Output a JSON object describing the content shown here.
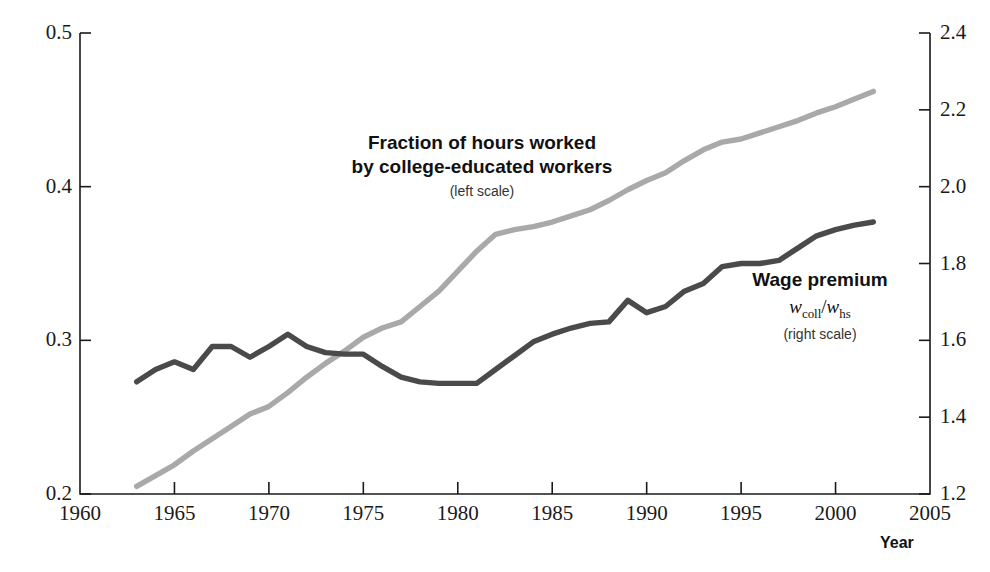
{
  "chart_data": {
    "type": "line",
    "title": "",
    "xlabel": "Year",
    "ylabel": "",
    "grid": false,
    "legend_position": "inline-annotations",
    "x_axis": {
      "label": "Year",
      "min": 1960,
      "max": 2005,
      "ticks": [
        1960,
        1965,
        1970,
        1975,
        1980,
        1985,
        1990,
        1995,
        2000,
        2005
      ],
      "tick_labels": [
        "1960",
        "1965",
        "1970",
        "1975",
        "1980",
        "1985",
        "1990",
        "1995",
        "2000",
        "2005"
      ]
    },
    "y_axis_left": {
      "min": 0.2,
      "max": 0.5,
      "ticks": [
        0.2,
        0.3,
        0.4,
        0.5
      ],
      "tick_labels": [
        "0.2",
        "0.3",
        "0.4",
        "0.5"
      ]
    },
    "y_axis_right": {
      "min": 1.2,
      "max": 2.4,
      "ticks": [
        1.2,
        1.4,
        1.6,
        1.8,
        2.0,
        2.2,
        2.4
      ],
      "tick_labels": [
        "1.2",
        "1.4",
        "1.6",
        "1.8",
        "2.0",
        "2.2",
        "2.4"
      ]
    },
    "series": [
      {
        "name": "Fraction of hours worked by college-educated workers",
        "axis": "left",
        "color": "#a9a9a9",
        "x": [
          1963,
          1964,
          1965,
          1966,
          1967,
          1968,
          1969,
          1970,
          1971,
          1972,
          1973,
          1974,
          1975,
          1976,
          1977,
          1978,
          1979,
          1980,
          1981,
          1982,
          1983,
          1984,
          1985,
          1986,
          1987,
          1988,
          1989,
          1990,
          1991,
          1992,
          1993,
          1994,
          1995,
          1996,
          1997,
          1998,
          1999,
          2000,
          2001,
          2002
        ],
        "values": [
          0.205,
          0.212,
          0.219,
          0.228,
          0.236,
          0.244,
          0.252,
          0.257,
          0.266,
          0.276,
          0.285,
          0.293,
          0.302,
          0.308,
          0.312,
          0.322,
          0.332,
          0.345,
          0.358,
          0.369,
          0.372,
          0.374,
          0.377,
          0.381,
          0.385,
          0.391,
          0.398,
          0.404,
          0.409,
          0.417,
          0.424,
          0.429,
          0.431,
          0.435,
          0.439,
          0.443,
          0.448,
          0.452,
          0.457,
          0.462
        ]
      },
      {
        "name": "Wage premium (w_coll / w_hs)",
        "axis": "right",
        "color": "#4a4a4a",
        "x": [
          1963,
          1964,
          1965,
          1966,
          1967,
          1968,
          1969,
          1970,
          1971,
          1972,
          1973,
          1974,
          1975,
          1976,
          1977,
          1978,
          1979,
          1980,
          1981,
          1982,
          1983,
          1984,
          1985,
          1986,
          1987,
          1988,
          1989,
          1990,
          1991,
          1992,
          1993,
          1994,
          1995,
          1996,
          1997,
          1998,
          1999,
          2000,
          2001,
          2002
        ],
        "values_left_scale": [
          0.273,
          0.281,
          0.286,
          0.281,
          0.296,
          0.296,
          0.289,
          0.296,
          0.304,
          0.296,
          0.292,
          0.291,
          0.291,
          0.283,
          0.276,
          0.273,
          0.272,
          0.272,
          0.272,
          0.281,
          0.29,
          0.299,
          0.304,
          0.308,
          0.311,
          0.312,
          0.326,
          0.318,
          0.322,
          0.332,
          0.337,
          0.348,
          0.35,
          0.35,
          0.352,
          0.36,
          0.368,
          0.372,
          0.375,
          0.377
        ],
        "values": [
          1.492,
          1.524,
          1.544,
          1.524,
          1.584,
          1.584,
          1.556,
          1.584,
          1.616,
          1.584,
          1.568,
          1.564,
          1.564,
          1.532,
          1.504,
          1.492,
          1.488,
          1.488,
          1.488,
          1.524,
          1.56,
          1.596,
          1.616,
          1.632,
          1.644,
          1.648,
          1.704,
          1.672,
          1.688,
          1.728,
          1.748,
          1.792,
          1.8,
          1.8,
          1.808,
          1.84,
          1.872,
          1.888,
          1.9,
          1.908
        ]
      }
    ],
    "annotations": [
      {
        "id": "fraction",
        "title_line1": "Fraction of hours worked",
        "title_line2": "by college-educated workers",
        "sub": "(left scale)"
      },
      {
        "id": "wage",
        "title_line1": "Wage premium",
        "formula_num": "w",
        "formula_num_sub": "coll",
        "formula_sep": "/",
        "formula_den": "w",
        "formula_den_sub": "hs",
        "sub": "(right scale)"
      }
    ]
  },
  "axis_title_year": "Year",
  "colors": {
    "series_fraction": "#a9a9a9",
    "series_wage": "#4a4a4a",
    "axis": "#1a1a1a",
    "background": "#ffffff"
  }
}
